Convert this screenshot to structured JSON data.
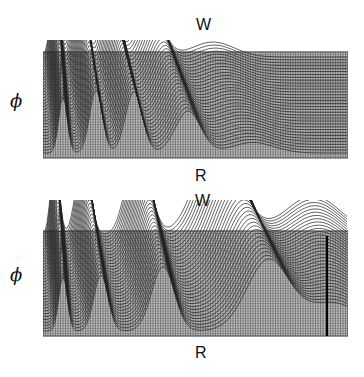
{
  "figure": {
    "top_panel": {
      "label_top": "W",
      "label_left": "ϕ",
      "label_bottom": "R"
    },
    "bottom_panel": {
      "label_top": "W",
      "label_left": "ϕ",
      "label_bottom": "R"
    }
  },
  "colors": {
    "grid": "#555555",
    "background": "#ffffff",
    "ink": "#111111"
  }
}
